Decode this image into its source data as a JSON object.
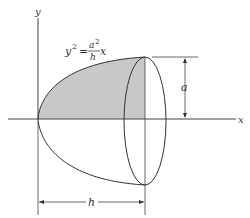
{
  "figure": {
    "axes": {
      "x_label": "x",
      "y_label": "y"
    },
    "equation": {
      "lhs": "y",
      "lhs_exp": "2",
      "equals": "=",
      "num": "a",
      "num_exp": "2",
      "den": "h",
      "var": "x"
    },
    "dimensions": {
      "height_label": "a",
      "length_label": "h"
    },
    "colors": {
      "shade": "#c8c8c8",
      "line": "#333333"
    }
  }
}
